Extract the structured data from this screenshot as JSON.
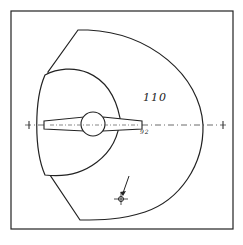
{
  "diagram": {
    "zone_label": "110",
    "small_label": "92",
    "colors": {
      "stroke": "#222222",
      "background": "#ffffff"
    }
  }
}
